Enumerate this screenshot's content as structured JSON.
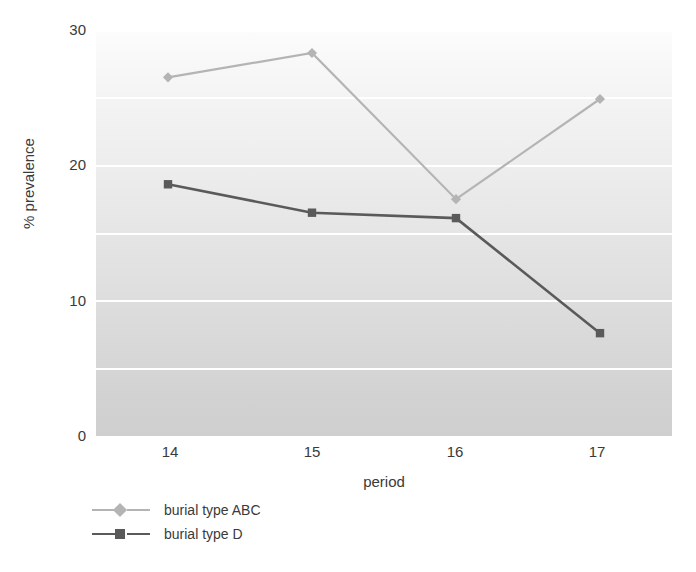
{
  "chart_data": {
    "type": "line",
    "title": "",
    "xlabel": "period",
    "ylabel": "% prevalence",
    "categories": [
      "14",
      "15",
      "16",
      "17"
    ],
    "x": [
      14,
      15,
      16,
      17
    ],
    "series": [
      {
        "name": "burial type ABC",
        "values": [
          26.5,
          28.3,
          17.5,
          24.9
        ],
        "color": "#b4b4b4",
        "marker": "diamond"
      },
      {
        "name": "burial type D",
        "values": [
          18.6,
          16.5,
          16.1,
          7.6
        ],
        "color": "#5a5a5a",
        "marker": "square"
      }
    ],
    "ylim": [
      0,
      30
    ],
    "xlim": [
      13.5,
      17.5
    ],
    "yticks": [
      "30",
      "20",
      "10",
      "0"
    ],
    "ytick_values": [
      30,
      20,
      10,
      0
    ],
    "xticks": [
      "14",
      "15",
      "16",
      "17"
    ],
    "gridlines_y": [
      5,
      10,
      15,
      20,
      25,
      30
    ],
    "grid": true,
    "grid_color": "#ffffff",
    "legend_position": "bottom-left",
    "background": "banded-gradient-gray"
  },
  "axes": {
    "y_title": "% prevalence",
    "x_title": "period",
    "y_ticks": [
      {
        "label": "30",
        "value": 30
      },
      {
        "label": "20",
        "value": 20
      },
      {
        "label": "10",
        "value": 10
      },
      {
        "label": "0",
        "value": 0
      }
    ],
    "x_ticks": [
      {
        "label": "14",
        "value": 14
      },
      {
        "label": "15",
        "value": 15
      },
      {
        "label": "16",
        "value": 16
      },
      {
        "label": "17",
        "value": 17
      }
    ]
  },
  "legend": {
    "entries": [
      {
        "label": "burial type ABC",
        "color": "#b4b4b4",
        "marker": "diamond"
      },
      {
        "label": "burial type D",
        "color": "#5a5a5a",
        "marker": "square"
      }
    ]
  },
  "colors": {
    "series_abc": "#b4b4b4",
    "series_d": "#5a5a5a",
    "grid": "#ffffff",
    "text": "#3a3a3a",
    "plot_background_top": "#fcfcfc",
    "plot_background_bottom": "#cfcfcf"
  }
}
